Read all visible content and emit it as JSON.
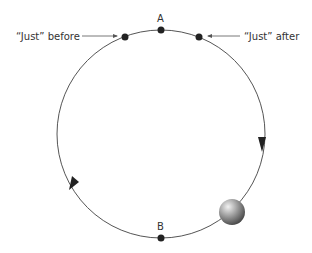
{
  "diagram": {
    "type": "circular-motion",
    "labels": {
      "top_point": "A",
      "bottom_point": "B",
      "before": "“Just” before",
      "after": "“Just” after"
    },
    "colors": {
      "path": "#555555",
      "dot": "#222222",
      "ball": "#888888"
    }
  }
}
